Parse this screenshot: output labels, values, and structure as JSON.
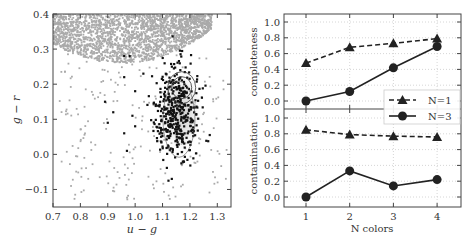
{
  "chart_data": [
    {
      "type": "scatter",
      "title": "",
      "xlabel": "u − g",
      "ylabel": "g − r",
      "xlim": [
        0.7,
        1.35
      ],
      "ylim": [
        -0.15,
        0.4
      ],
      "xticks": [
        "0.7",
        "0.8",
        "0.9",
        "1.0",
        "1.1",
        "1.2",
        "1.3"
      ],
      "yticks": [
        "−0.1",
        "0.0",
        "0.1",
        "0.2",
        "0.3",
        "0.4"
      ],
      "grid": false,
      "series": [
        {
          "name": "background stars",
          "color": "#aaaaaa",
          "description": "dense gray cloud concentrated above g−r≈0.28 across u−g 0.7–1.25, with sparse scatter extending down to g−r≈−0.13"
        },
        {
          "name": "selected objects",
          "color": "#111111",
          "description": "black points clustered at u−g≈1.08–1.25, g−r≈−0.05–0.23, with a few outliers toward u−g≈0.9–1.0"
        },
        {
          "name": "density contours",
          "color": "#333333",
          "description": "contour ellipses centered near u−g≈1.17, g−r≈0.15 with gray shaded density"
        }
      ]
    },
    {
      "type": "line",
      "title": "",
      "xlabel": "N colors",
      "ylabel": "completeness",
      "categories": [
        1,
        2,
        3,
        4
      ],
      "ylim": [
        -0.1,
        1.1
      ],
      "yticks": [
        "0.0",
        "0.2",
        "0.4",
        "0.6",
        "0.8",
        "1.0"
      ],
      "grid": true,
      "series": [
        {
          "name": "N=1",
          "style": "dashed",
          "marker": "triangle",
          "values": [
            0.48,
            0.68,
            0.73,
            0.79
          ]
        },
        {
          "name": "N=3",
          "style": "solid",
          "marker": "circle",
          "values": [
            0.0,
            0.12,
            0.42,
            0.69
          ]
        }
      ],
      "legend": {
        "position": "lower right",
        "entries": [
          "N=1",
          "N=3"
        ]
      }
    },
    {
      "type": "line",
      "title": "",
      "xlabel": "N colors",
      "ylabel": "contamination",
      "categories": [
        1,
        2,
        3,
        4
      ],
      "ylim": [
        -0.1,
        1.1
      ],
      "yticks": [
        "0.0",
        "0.2",
        "0.4",
        "0.6",
        "0.8",
        "1.0"
      ],
      "xticks": [
        "1",
        "2",
        "3",
        "4"
      ],
      "grid": true,
      "series": [
        {
          "name": "N=1",
          "style": "dashed",
          "marker": "triangle",
          "values": [
            0.85,
            0.79,
            0.77,
            0.76
          ]
        },
        {
          "name": "N=3",
          "style": "solid",
          "marker": "circle",
          "values": [
            0.0,
            0.33,
            0.14,
            0.22
          ]
        }
      ]
    }
  ],
  "labels": {
    "left_xlabel": "u − g",
    "left_ylabel": "g − r",
    "right_xlabel": "N colors",
    "top_ylabel": "completeness",
    "bottom_ylabel": "contamination",
    "legend_n1": "N=1",
    "legend_n3": "N=3"
  }
}
